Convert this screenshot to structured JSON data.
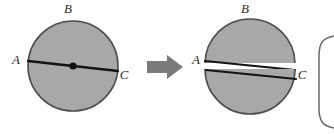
{
  "figure": {
    "background_color": "#ffffff",
    "fill_color": "#a8a8a8",
    "outline_color": "#555555",
    "line_color": "#1a1a1a",
    "arrow_color": "#7a7a7a",
    "bracket_color": "#5a5a5a"
  },
  "left_circle": {
    "name": "whole-circle",
    "center": {
      "x": 73,
      "y": 66
    },
    "radius": 45,
    "labels": {
      "top": "B",
      "left": "A",
      "right": "C"
    },
    "label_positions": {
      "top": {
        "x": 68,
        "y": 13
      },
      "left": {
        "x": 16,
        "y": 64
      },
      "right": {
        "x": 122,
        "y": 76
      }
    },
    "diameter": {
      "name": "diameter-AC",
      "from": {
        "x": 28,
        "y": 61
      },
      "to": {
        "x": 118,
        "y": 71
      }
    },
    "center_dot": {
      "name": "center-point",
      "x": 73,
      "y": 66,
      "radius": 3.5
    }
  },
  "arrow": {
    "name": "transformation-arrow",
    "direction": "right",
    "x": 147,
    "y": 58,
    "width": 36,
    "height": 18
  },
  "right_circle": {
    "name": "split-circle",
    "center": {
      "x": 250,
      "y": 66
    },
    "radius": 45,
    "gap": 6,
    "labels": {
      "top": "B",
      "left": "A",
      "right": "C"
    },
    "label_positions": {
      "top": {
        "x": 245,
        "y": 13
      },
      "left": {
        "x": 194,
        "y": 64
      },
      "right": {
        "x": 299,
        "y": 77
      }
    },
    "upper_half_name": "upper-semicircle",
    "lower_half_name": "lower-semicircle"
  },
  "bracket": {
    "name": "result-bracket",
    "x": 318,
    "y_top": 40,
    "y_bottom": 126,
    "clipped": true
  }
}
